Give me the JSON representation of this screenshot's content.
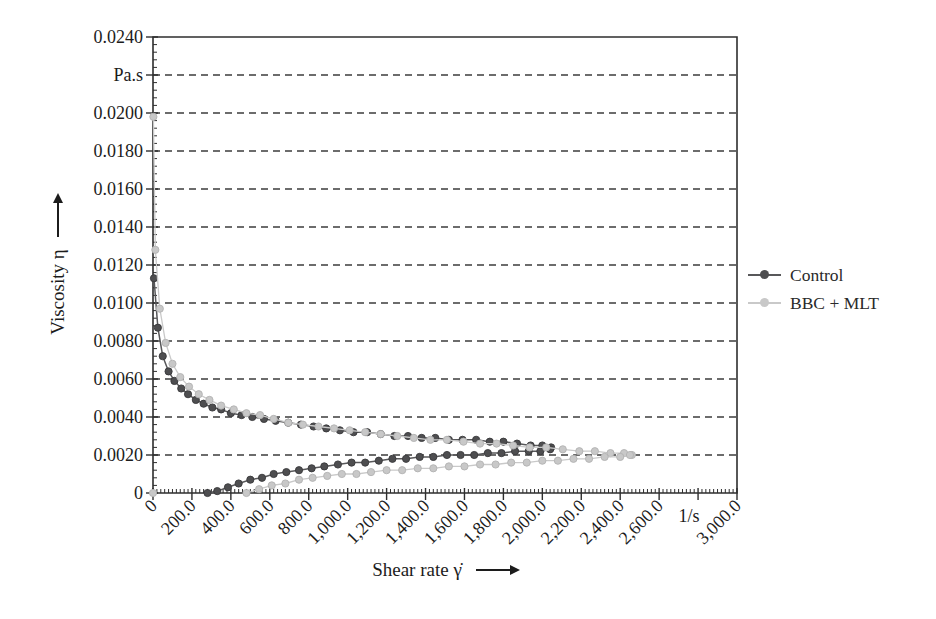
{
  "figure": {
    "background": "#ffffff"
  },
  "colors": {
    "frame": "#2e2e2e",
    "grid": "#3d3d3d",
    "tick": "#2e2e2e",
    "text": "#1c1c1c"
  },
  "chart_data": {
    "type": "line",
    "title": "",
    "xlabel": "Shear rate γ̇",
    "ylabel": "Viscosity η",
    "x_unit": "1/s",
    "y_unit": "Pa.s",
    "xlim": [
      0,
      3000
    ],
    "ylim": [
      0,
      0.024
    ],
    "grid": {
      "horizontal_dashed": true,
      "vertical": false
    },
    "legend_position": "right-outside",
    "x_minor_step": 20,
    "y_minor_step": 0.0004,
    "x_ticks": [
      {
        "value": 0,
        "label": "0"
      },
      {
        "value": 200,
        "label": "200.0"
      },
      {
        "value": 400,
        "label": "400.0"
      },
      {
        "value": 600,
        "label": "600.0"
      },
      {
        "value": 800,
        "label": "800.0"
      },
      {
        "value": 1000,
        "label": "1,000.0"
      },
      {
        "value": 1200,
        "label": "1,200.0"
      },
      {
        "value": 1400,
        "label": "1,400.0"
      },
      {
        "value": 1600,
        "label": "1,600.0"
      },
      {
        "value": 1800,
        "label": "1,800.0"
      },
      {
        "value": 2000,
        "label": "2,000.0"
      },
      {
        "value": 2200,
        "label": "2,200.0"
      },
      {
        "value": 2400,
        "label": "2,400.0"
      },
      {
        "value": 2600,
        "label": "2,600.0"
      },
      {
        "value": 2800,
        "label": "1/s",
        "horizontal": true
      },
      {
        "value": 3000,
        "label": "3,000.0"
      }
    ],
    "y_ticks": [
      {
        "value": 0,
        "label": "0"
      },
      {
        "value": 0.002,
        "label": "0.0020"
      },
      {
        "value": 0.004,
        "label": "0.0040"
      },
      {
        "value": 0.006,
        "label": "0.0060"
      },
      {
        "value": 0.008,
        "label": "0.0080"
      },
      {
        "value": 0.01,
        "label": "0.0100"
      },
      {
        "value": 0.012,
        "label": "0.0120"
      },
      {
        "value": 0.014,
        "label": "0.0140"
      },
      {
        "value": 0.016,
        "label": "0.0160"
      },
      {
        "value": 0.018,
        "label": "0.0180"
      },
      {
        "value": 0.02,
        "label": "0.0200"
      },
      {
        "value": 0.022,
        "label": "Pa.s"
      },
      {
        "value": 0.024,
        "label": "0.0240"
      }
    ],
    "series": [
      {
        "name": "Control",
        "id": "control",
        "line_color": "#58585a",
        "marker_fill": "#4e4e50",
        "marker_edge": "#39393b",
        "line_width": 1.5,
        "branches": {
          "upper_branch": [
            [
              5,
              0.0113
            ],
            [
              25,
              0.0087
            ],
            [
              50,
              0.0072
            ],
            [
              80,
              0.0064
            ],
            [
              110,
              0.0059
            ],
            [
              145,
              0.0055
            ],
            [
              180,
              0.0052
            ],
            [
              220,
              0.0049
            ],
            [
              260,
              0.0047
            ],
            [
              305,
              0.0045
            ],
            [
              350,
              0.0044
            ],
            [
              400,
              0.0042
            ],
            [
              455,
              0.0041
            ],
            [
              510,
              0.004
            ],
            [
              570,
              0.0039
            ],
            [
              630,
              0.0038
            ],
            [
              695,
              0.0037
            ],
            [
              760,
              0.0036
            ],
            [
              825,
              0.0035
            ],
            [
              890,
              0.0034
            ],
            [
              960,
              0.0033
            ],
            [
              1030,
              0.0032
            ],
            [
              1100,
              0.0032
            ],
            [
              1170,
              0.0031
            ],
            [
              1240,
              0.003
            ],
            [
              1310,
              0.003
            ],
            [
              1380,
              0.0029
            ],
            [
              1450,
              0.0029
            ],
            [
              1520,
              0.0028
            ],
            [
              1590,
              0.0028
            ],
            [
              1660,
              0.0028
            ],
            [
              1730,
              0.0027
            ],
            [
              1800,
              0.0027
            ],
            [
              1870,
              0.0026
            ],
            [
              1940,
              0.0025
            ],
            [
              2000,
              0.0025
            ],
            [
              2045,
              0.0024
            ]
          ],
          "lower_branch": [
            [
              280,
              0.0
            ],
            [
              330,
              0.0001
            ],
            [
              385,
              0.0003
            ],
            [
              440,
              0.0005
            ],
            [
              500,
              0.0007
            ],
            [
              560,
              0.0008
            ],
            [
              620,
              0.001
            ],
            [
              685,
              0.0011
            ],
            [
              750,
              0.0012
            ],
            [
              815,
              0.0013
            ],
            [
              880,
              0.0014
            ],
            [
              950,
              0.0015
            ],
            [
              1020,
              0.0016
            ],
            [
              1090,
              0.0016
            ],
            [
              1160,
              0.0017
            ],
            [
              1230,
              0.0018
            ],
            [
              1300,
              0.0018
            ],
            [
              1370,
              0.0019
            ],
            [
              1440,
              0.0019
            ],
            [
              1510,
              0.002
            ],
            [
              1580,
              0.002
            ],
            [
              1650,
              0.002
            ],
            [
              1720,
              0.0021
            ],
            [
              1790,
              0.0021
            ],
            [
              1860,
              0.0022
            ],
            [
              1930,
              0.0022
            ],
            [
              1990,
              0.0022
            ],
            [
              2040,
              0.0023
            ]
          ]
        }
      },
      {
        "name": "BBC + MLT",
        "id": "bbc-mlt",
        "line_color": "#c9c9c9",
        "marker_fill": "#c8c8c8",
        "marker_edge": "#b2b2b2",
        "line_width": 1.3,
        "branches": {
          "origin_point": [
            [
              0,
              0.0
            ]
          ],
          "upper_branch": [
            [
              2,
              0.0198
            ],
            [
              12,
              0.0128
            ],
            [
              35,
              0.0097
            ],
            [
              65,
              0.0079
            ],
            [
              100,
              0.0068
            ],
            [
              140,
              0.0061
            ],
            [
              185,
              0.0056
            ],
            [
              235,
              0.0052
            ],
            [
              290,
              0.0049
            ],
            [
              350,
              0.0046
            ],
            [
              415,
              0.0044
            ],
            [
              480,
              0.0042
            ],
            [
              550,
              0.0041
            ],
            [
              620,
              0.0039
            ],
            [
              695,
              0.0037
            ],
            [
              770,
              0.0036
            ],
            [
              850,
              0.0035
            ],
            [
              930,
              0.0034
            ],
            [
              1010,
              0.0033
            ],
            [
              1090,
              0.0032
            ],
            [
              1170,
              0.0031
            ],
            [
              1255,
              0.003
            ],
            [
              1340,
              0.0029
            ],
            [
              1425,
              0.0028
            ],
            [
              1510,
              0.0028
            ],
            [
              1595,
              0.0027
            ],
            [
              1680,
              0.0026
            ],
            [
              1765,
              0.0026
            ],
            [
              1850,
              0.0025
            ],
            [
              1935,
              0.0024
            ],
            [
              2020,
              0.0024
            ],
            [
              2105,
              0.0023
            ],
            [
              2190,
              0.0022
            ],
            [
              2270,
              0.0022
            ],
            [
              2350,
              0.0021
            ],
            [
              2420,
              0.0021
            ],
            [
              2460,
              0.002
            ]
          ],
          "lower_branch": [
            [
              480,
              0.0
            ],
            [
              545,
              0.0002
            ],
            [
              610,
              0.0004
            ],
            [
              680,
              0.0005
            ],
            [
              750,
              0.0007
            ],
            [
              820,
              0.0008
            ],
            [
              895,
              0.0009
            ],
            [
              970,
              0.001
            ],
            [
              1045,
              0.001
            ],
            [
              1120,
              0.0011
            ],
            [
              1200,
              0.0012
            ],
            [
              1280,
              0.0012
            ],
            [
              1360,
              0.0013
            ],
            [
              1440,
              0.0013
            ],
            [
              1520,
              0.0014
            ],
            [
              1600,
              0.0014
            ],
            [
              1680,
              0.0015
            ],
            [
              1760,
              0.0015
            ],
            [
              1840,
              0.0016
            ],
            [
              1920,
              0.0016
            ],
            [
              2000,
              0.0017
            ],
            [
              2080,
              0.0017
            ],
            [
              2160,
              0.0018
            ],
            [
              2240,
              0.0018
            ],
            [
              2320,
              0.0019
            ],
            [
              2400,
              0.0019
            ],
            [
              2450,
              0.002
            ]
          ]
        }
      }
    ]
  }
}
